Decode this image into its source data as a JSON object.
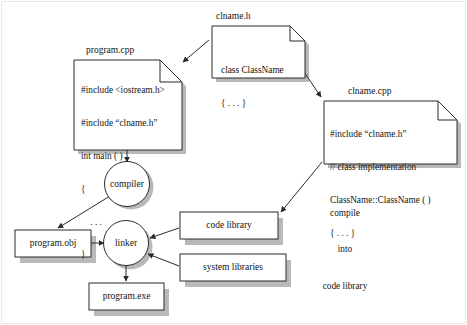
{
  "diagram": {
    "colors": {
      "stroke": "#2b2b2b",
      "fill": "#ffffff",
      "shadow": "#b9b9b9",
      "text": "#141414",
      "frame": "#e9e9e9"
    },
    "nodes": {
      "clname_h": {
        "caption": "clname.h",
        "lines": [
          "class ClassName",
          "{ . . . }"
        ]
      },
      "program_cpp": {
        "caption": "program.cpp",
        "lines": [
          "#include <iostream.h>",
          "#include “clname.h”",
          "int main ( )",
          "{",
          "    . . .",
          "}"
        ]
      },
      "clname_cpp": {
        "caption": "clname.cpp",
        "lines": [
          "#include “clname.h”",
          "// class implementation",
          "ClassName::ClassName ( )",
          "{ . . . }"
        ]
      },
      "compiler": {
        "label": "compiler"
      },
      "linker": {
        "label": "linker"
      },
      "program_obj": {
        "label": "program.obj"
      },
      "program_exe": {
        "label": "program.exe"
      },
      "code_library": {
        "label": "code library"
      },
      "system_libraries": {
        "label": "system libraries"
      }
    },
    "annotations": {
      "compile_into_code_library": [
        "compile",
        "into",
        "code library"
      ]
    }
  }
}
